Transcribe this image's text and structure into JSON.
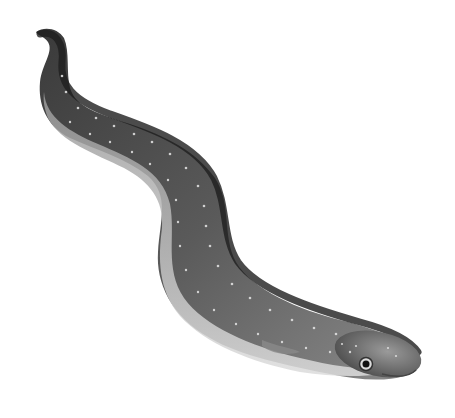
{
  "image": {
    "subject": "eel illustration",
    "width": 455,
    "height": 418,
    "background": "#ffffff",
    "colors": {
      "dark_back": "#2a2a2a",
      "mid_body": "#6e6e6e",
      "light_belly": "#d8d8d8",
      "spots": "#e8e8e8"
    }
  }
}
